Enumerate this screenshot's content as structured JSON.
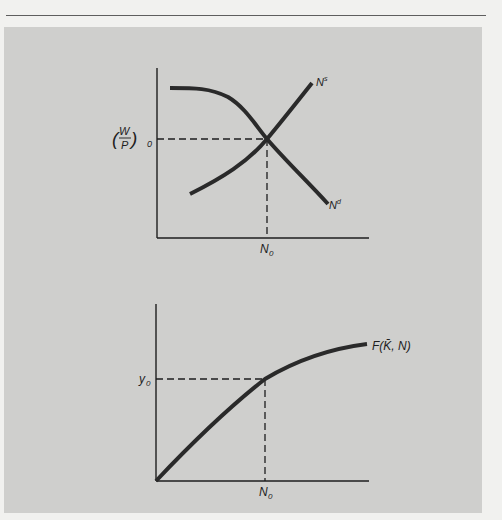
{
  "figure": {
    "top_panel": {
      "description": "Labor market equilibrium",
      "y_label": {
        "prefix": "(",
        "num": "W",
        "den": "P",
        "suffix": ")",
        "sub": "0"
      },
      "x_tick_label": {
        "main": "N",
        "sub": "0"
      },
      "supply_label": {
        "main": "N",
        "sup": "s"
      },
      "demand_label": {
        "main": "N",
        "sup": "d"
      }
    },
    "bottom_panel": {
      "description": "Production function",
      "y_tick_label": {
        "main": "y",
        "sub": "0"
      },
      "x_tick_label": {
        "main": "N",
        "sub": "0"
      },
      "curve_label": "F(K̄, N)"
    }
  },
  "colors": {
    "page_background": "#f1f1ef",
    "panel_background": "#cfcfcd",
    "ink": "#1e1e1e",
    "curve": "#2a2a2a"
  }
}
